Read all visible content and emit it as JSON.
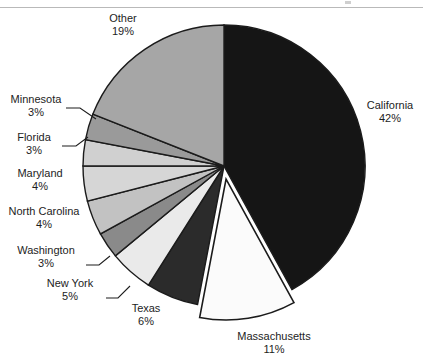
{
  "chart_data": {
    "type": "pie",
    "title": "",
    "subtitle": "",
    "xlabel": "",
    "ylabel": "",
    "legend_position": "none",
    "grid": false,
    "units": "percent",
    "start_angle_deg": 0,
    "direction": "clockwise",
    "exploded_slices": [
      "Massachusetts"
    ],
    "categories": [
      "California",
      "Massachusetts",
      "Texas",
      "New York",
      "Washington",
      "North Carolina",
      "Maryland",
      "Florida",
      "Minnesota",
      "Other"
    ],
    "values": [
      42,
      11,
      6,
      5,
      3,
      4,
      4,
      3,
      3,
      19
    ],
    "value_labels": [
      "42%",
      "11%",
      "6%",
      "5%",
      "3%",
      "4%",
      "4%",
      "3%",
      "3%",
      "19%"
    ],
    "slice_colors": [
      "#151515",
      "#fbfbfb",
      "#2b2b2b",
      "#eaeaea",
      "#8a8a8a",
      "#c2c2c2",
      "#d6d6d6",
      "#d0d0d0",
      "#9a9a9a",
      "#a6a6a6"
    ],
    "slice_outline_color": "#1b1b1b",
    "slices": [
      {
        "label": "California",
        "value": 42,
        "value_label": "42%",
        "color": "#151515",
        "exploded": false
      },
      {
        "label": "Massachusetts",
        "value": 11,
        "value_label": "11%",
        "color": "#fbfbfb",
        "exploded": true
      },
      {
        "label": "Texas",
        "value": 6,
        "value_label": "6%",
        "color": "#2b2b2b",
        "exploded": false
      },
      {
        "label": "New York",
        "value": 5,
        "value_label": "5%",
        "color": "#eaeaea",
        "exploded": false
      },
      {
        "label": "Washington",
        "value": 3,
        "value_label": "3%",
        "color": "#8a8a8a",
        "exploded": false
      },
      {
        "label": "North Carolina",
        "value": 4,
        "value_label": "4%",
        "color": "#c2c2c2",
        "exploded": false
      },
      {
        "label": "Maryland",
        "value": 4,
        "value_label": "4%",
        "color": "#d6d6d6",
        "exploded": false
      },
      {
        "label": "Florida",
        "value": 3,
        "value_label": "3%",
        "color": "#d0d0d0",
        "exploded": false
      },
      {
        "label": "Minnesota",
        "value": 3,
        "value_label": "3%",
        "color": "#9a9a9a",
        "exploded": false
      },
      {
        "label": "Other",
        "value": 19,
        "value_label": "19%",
        "color": "#a6a6a6",
        "exploded": false
      }
    ]
  },
  "labels": {
    "other": {
      "name": "Other",
      "value": "19%"
    },
    "minnesota": {
      "name": "Minnesota",
      "value": "3%"
    },
    "florida": {
      "name": "Florida",
      "value": "3%"
    },
    "maryland": {
      "name": "Maryland",
      "value": "4%"
    },
    "north_carolina": {
      "name": "North Carolina",
      "value": "4%"
    },
    "washington": {
      "name": "Washington",
      "value": "3%"
    },
    "new_york": {
      "name": "New York",
      "value": "5%"
    },
    "texas": {
      "name": "Texas",
      "value": "6%"
    },
    "massachusetts": {
      "name": "Massachusetts",
      "value": "11%"
    },
    "california": {
      "name": "California",
      "value": "42%"
    }
  }
}
